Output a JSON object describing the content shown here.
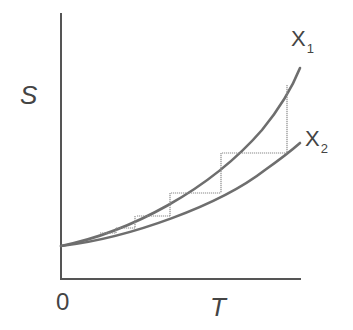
{
  "diagram": {
    "y_axis_label": "S",
    "x_axis_label": "T",
    "origin_label": "0",
    "curves": [
      {
        "name": "X",
        "subscript": "1",
        "role": "upper-curve"
      },
      {
        "name": "X",
        "subscript": "2",
        "role": "lower-curve"
      }
    ],
    "colors": {
      "axis": "#555555",
      "curve": "#6e6e6e",
      "step": "#8a8a8a",
      "text": "#444444",
      "background": "#ffffff"
    }
  }
}
